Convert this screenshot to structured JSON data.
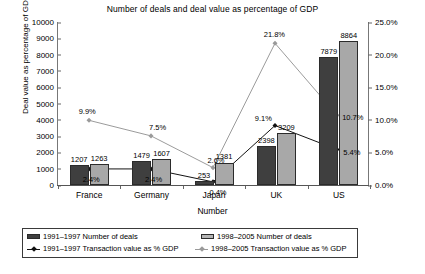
{
  "chart_data": {
    "type": "bar",
    "title": "Number of deals and deal value as percentage of GDP",
    "xlabel": "Number",
    "ylabel": "Deal value as percentage of GDP",
    "categories": [
      "France",
      "Germany",
      "Japan",
      "UK",
      "US"
    ],
    "ylim": [
      0,
      10000
    ],
    "y_ticks": [
      "0",
      "1000",
      "2000",
      "3000",
      "4000",
      "5000",
      "6000",
      "7000",
      "8000",
      "9000",
      "10000"
    ],
    "y2lim": [
      0,
      25
    ],
    "y2_ticks": [
      "0.0%",
      "5.0%",
      "10.0%",
      "15.0%",
      "20.0%",
      "25.0%"
    ],
    "grid": false,
    "legend_position": "bottom",
    "series": [
      {
        "name": "1991–1997 Number of deals",
        "kind": "bar",
        "axis": "left",
        "color": "#3f3f3f",
        "values": [
          1207,
          1479,
          253,
          2398,
          7879
        ],
        "labels": [
          "1207",
          "1479",
          "253",
          "2398",
          "7879"
        ]
      },
      {
        "name": "1998–2005 Number of deals",
        "kind": "bar",
        "axis": "left",
        "color": "#a8a8a8",
        "values": [
          1263,
          1607,
          1381,
          3209,
          8864
        ],
        "labels": [
          "1263",
          "1607",
          "1381",
          "3209",
          "8864"
        ]
      },
      {
        "name": "1991–1997 Transaction value as % GDP",
        "kind": "line",
        "axis": "right",
        "color": "#111111",
        "values": [
          2.4,
          2.4,
          0.4,
          9.1,
          5.4
        ],
        "labels": [
          "2.4%",
          "2.4%",
          "0.4%",
          "9.1%",
          "5.4%"
        ]
      },
      {
        "name": "1998–2005 Transaction value as % GDP",
        "kind": "line",
        "axis": "right",
        "color": "#9a9a9a",
        "values": [
          9.9,
          7.5,
          2.6,
          21.8,
          10.7
        ],
        "labels": [
          "9.9%",
          "7.5%",
          "2.6%",
          "21.8%",
          "10.7%"
        ]
      }
    ]
  }
}
